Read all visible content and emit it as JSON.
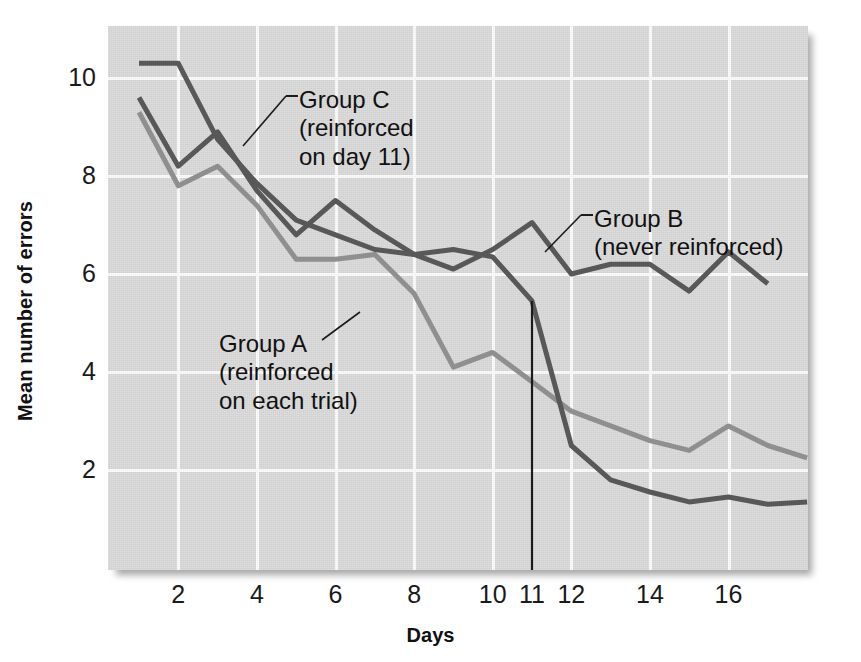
{
  "axes": {
    "ylabel": "Mean number of errors",
    "xlabel": "Days",
    "yticks": [
      "10",
      "8",
      "6",
      "4",
      "2"
    ],
    "xticks": [
      "2",
      "4",
      "6",
      "8",
      "10",
      "11",
      "12",
      "14",
      "16"
    ]
  },
  "annotations": {
    "group_c": "Group C\n(reinforced\non day 11)",
    "group_a": "Group A\n(reinforced\non each trial)",
    "group_b": "Group B\n(never reinforced)"
  },
  "colors": {
    "panel": "#d9d9d9",
    "grid": "#fbfbfb",
    "group_a": "#8f8f8f",
    "group_b": "#585858",
    "group_c": "#585858",
    "marker_line": "#1b1b1b",
    "text": "#111111"
  },
  "chart_data": {
    "type": "line",
    "title": "",
    "xlabel": "Days",
    "ylabel": "Mean number of errors",
    "xlim": [
      0.3,
      18.5
    ],
    "ylim": [
      0.2,
      11.1
    ],
    "ytick_values": [
      10,
      8,
      6,
      4,
      2
    ],
    "xtick_values": [
      2,
      4,
      6,
      8,
      10,
      11,
      12,
      14,
      16
    ],
    "grid": true,
    "legend_position": "inline-annotations",
    "annotations": [
      {
        "text": "Group C (reinforced on day 11)",
        "series": "Group C",
        "points_at_day": 6
      },
      {
        "text": "Group A (reinforced on each trial)",
        "series": "Group A",
        "points_at_day": 8
      },
      {
        "text": "Group B (never reinforced)",
        "series": "Group B",
        "points_at_day": 12
      }
    ],
    "vertical_marker": {
      "x": 11,
      "label": "day 11",
      "note": "reinforcement introduced for Group C"
    },
    "x": [
      1,
      2,
      3,
      4,
      5,
      6,
      7,
      8,
      9,
      10,
      11,
      12,
      13,
      14,
      15,
      16,
      17,
      18
    ],
    "series": [
      {
        "name": "Group A",
        "label": "Group A (reinforced on each trial)",
        "color": "#8f8f8f",
        "values": [
          9.3,
          7.8,
          8.2,
          7.4,
          6.3,
          6.3,
          6.4,
          5.6,
          4.1,
          4.4,
          3.8,
          3.2,
          2.9,
          2.6,
          2.4,
          2.9,
          2.5,
          2.25
        ]
      },
      {
        "name": "Group B",
        "label": "Group B (never reinforced)",
        "color": "#585858",
        "values": [
          9.6,
          8.2,
          8.9,
          7.7,
          6.8,
          7.5,
          6.9,
          6.4,
          6.1,
          6.5,
          7.05,
          6.0,
          6.2,
          6.2,
          5.65,
          6.45,
          5.8,
          null
        ]
      },
      {
        "name": "Group C",
        "label": "Group C (reinforced on day 11)",
        "color": "#585858",
        "values": [
          10.3,
          10.3,
          8.75,
          7.85,
          7.1,
          6.8,
          6.5,
          6.4,
          6.5,
          6.35,
          5.45,
          2.5,
          1.8,
          1.55,
          1.35,
          1.45,
          1.3,
          1.35
        ]
      }
    ]
  }
}
